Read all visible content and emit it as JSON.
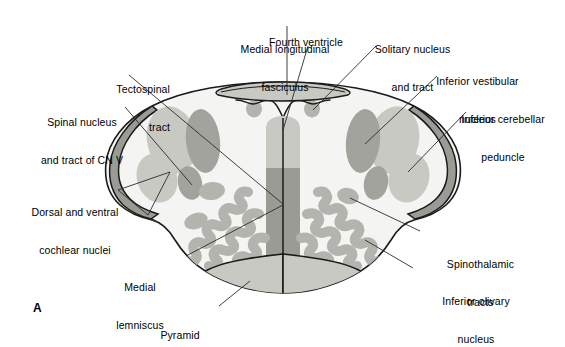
{
  "figure": {
    "panel_letter": "A",
    "colors": {
      "outline": "#1a1a1a",
      "parenchyma": "#f4f4f2",
      "gray_light": "#c9c9c4",
      "gray_mid": "#b4b4ae",
      "gray_dark": "#9b9b95",
      "gray_darkest": "#8a8a84",
      "leader_line": "#2b2b2b",
      "background": "#ffffff",
      "text": "#000000"
    }
  },
  "labels": [
    {
      "id": "medial-longitudinal-fasciculus",
      "line1": "Medial longitudinal",
      "line2": "fasciculus",
      "align": "center",
      "x": 220,
      "y": 18,
      "width": 130
    },
    {
      "id": "fourth-ventricle",
      "line1": "Fourth ventricle",
      "line2": "",
      "align": "center",
      "x": 256,
      "y": 11,
      "width": 100
    },
    {
      "id": "solitary-nucleus-and-tract",
      "line1": "Solitary nucleus",
      "line2": "and tract",
      "align": "center",
      "x": 360,
      "y": 18,
      "width": 105
    },
    {
      "id": "inferior-vestibular-nucleus",
      "line1": "Inferior vestibular",
      "line2": "nucleus",
      "align": "center",
      "x": 420,
      "y": 50,
      "width": 115
    },
    {
      "id": "tectospinal-tract",
      "line1": "Tectospinal",
      "line2": "tract",
      "align": "right",
      "x": 60,
      "y": 58,
      "width": 110
    },
    {
      "id": "inferior-cerebellar-peduncle",
      "line1": "Inferior cerebellar",
      "line2": "peduncle",
      "align": "center",
      "x": 443,
      "y": 88,
      "width": 120
    },
    {
      "id": "spinal-nucleus-and-tract-of-cn-v",
      "line1": "Spinal nucleus",
      "line2": "and tract of CN V",
      "align": "center",
      "x": 22,
      "y": 91,
      "width": 120
    },
    {
      "id": "dorsal-and-ventral-cochlear-nuclei",
      "line1": "Dorsal and ventral",
      "line2": "cochlear nuclei",
      "align": "center",
      "x": 12,
      "y": 181,
      "width": 126
    },
    {
      "id": "medial-lemniscus",
      "line1": "Medial",
      "line2": "lemniscus",
      "align": "center",
      "x": 97,
      "y": 256,
      "width": 86
    },
    {
      "id": "spinothalamic-tracts",
      "line1": "Spinothalamic",
      "line2": "tracts",
      "align": "center",
      "x": 423,
      "y": 233,
      "width": 115
    },
    {
      "id": "inferior-olivary-nucleus",
      "line1": "Inferior olivary",
      "line2": "nucleus",
      "align": "center",
      "x": 416,
      "y": 270,
      "width": 120
    },
    {
      "id": "pyramid",
      "line1": "Pyramid",
      "line2": "",
      "align": "center",
      "x": 140,
      "y": 304,
      "width": 80
    }
  ],
  "structures": [
    {
      "id": "medulla-outline",
      "name": "Medulla oblongata outline"
    },
    {
      "id": "fourth-ventricle-roof",
      "name": "Fourth ventricle"
    },
    {
      "id": "mlf-column",
      "name": "Medial longitudinal fasciculus"
    },
    {
      "id": "tectospinal-column",
      "name": "Tectospinal tract"
    },
    {
      "id": "solitary-nucleus-left",
      "name": "Solitary nucleus and tract (left)"
    },
    {
      "id": "solitary-nucleus-right",
      "name": "Solitary nucleus and tract (right)"
    },
    {
      "id": "inferior-vestibular-nucleus-left",
      "name": "Inferior vestibular nucleus (left)"
    },
    {
      "id": "inferior-vestibular-nucleus-right",
      "name": "Inferior vestibular nucleus (right)"
    },
    {
      "id": "inferior-cerebellar-peduncle-left",
      "name": "Inferior cerebellar peduncle (left)"
    },
    {
      "id": "inferior-cerebellar-peduncle-right",
      "name": "Inferior cerebellar peduncle (right)"
    },
    {
      "id": "spinal-tract-cn5-left",
      "name": "Spinal tract of CN V (left)"
    },
    {
      "id": "spinal-tract-cn5-right",
      "name": "Spinal tract of CN V (right)"
    },
    {
      "id": "spinothalamic-left",
      "name": "Spinothalamic tracts (left)"
    },
    {
      "id": "spinothalamic-right",
      "name": "Spinothalamic tracts (right)"
    },
    {
      "id": "inferior-olivary-left",
      "name": "Inferior olivary nucleus (left)"
    },
    {
      "id": "inferior-olivary-right",
      "name": "Inferior olivary nucleus (right)"
    },
    {
      "id": "pyramid-left",
      "name": "Pyramid (left)"
    },
    {
      "id": "pyramid-right",
      "name": "Pyramid (right)"
    },
    {
      "id": "cochlear-nucleus-left",
      "name": "Dorsal and ventral cochlear nuclei (left)"
    }
  ]
}
